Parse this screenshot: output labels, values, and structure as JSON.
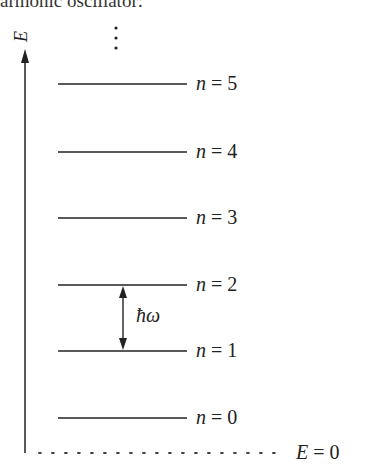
{
  "caption": "armonic oscillator:",
  "axis": {
    "label": "E",
    "zero_label_var": "E",
    "zero_label_eq": "= 0"
  },
  "continuation": "⋮",
  "spacing_label": "ħω",
  "levels": [
    {
      "n_var": "n",
      "eq": "= 5",
      "y": 84
    },
    {
      "n_var": "n",
      "eq": "= 4",
      "y": 152
    },
    {
      "n_var": "n",
      "eq": "= 3",
      "y": 218
    },
    {
      "n_var": "n",
      "eq": "= 2",
      "y": 285
    },
    {
      "n_var": "n",
      "eq": "= 1",
      "y": 351
    },
    {
      "n_var": "n",
      "eq": "= 0",
      "y": 418
    }
  ]
}
